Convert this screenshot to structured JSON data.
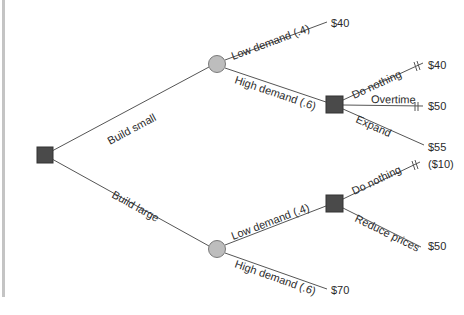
{
  "diagram": {
    "type": "decision-tree",
    "root": {
      "node_type": "decision",
      "branches": [
        {
          "label": "Build small",
          "node_type": "chance",
          "branches": [
            {
              "label": "Low demand (.4)",
              "payoff": "$40"
            },
            {
              "label": "High demand (.6)",
              "node_type": "decision",
              "branches": [
                {
                  "label": "Do nothing",
                  "payoff": "$40",
                  "pruned": true
                },
                {
                  "label": "Overtime",
                  "payoff": "$50",
                  "pruned": true
                },
                {
                  "label": "Expand",
                  "payoff": "$55",
                  "pruned": false
                }
              ]
            }
          ]
        },
        {
          "label": "Build large",
          "node_type": "chance",
          "branches": [
            {
              "label": "Low demand (.4)",
              "node_type": "decision",
              "branches": [
                {
                  "label": "Do nothing",
                  "payoff": "($10)",
                  "pruned": true
                },
                {
                  "label": "Reduce prices",
                  "payoff": "$50",
                  "pruned": false
                }
              ]
            },
            {
              "label": "High demand (.6)",
              "payoff": "$70"
            }
          ]
        }
      ]
    },
    "labels": {
      "build_small": "Build small",
      "build_large": "Build large",
      "bs_low": "Low demand (.4)",
      "bs_high": "High demand (.6)",
      "bs_do_nothing": "Do nothing",
      "bs_overtime": "Overtime",
      "bs_expand": "Expand",
      "bl_low": "Low demand (.4)",
      "bl_high": "High demand (.6)",
      "bl_do_nothing": "Do nothing",
      "bl_reduce_prices": "Reduce prices"
    },
    "payoffs": {
      "bs_low": "$40",
      "bs_do_nothing": "$40",
      "bs_overtime": "$50",
      "bs_expand": "$55",
      "bl_do_nothing": "($10)",
      "bl_reduce_prices": "$50",
      "bl_high": "$70"
    },
    "colors": {
      "decision_node": "#4a4a4a",
      "chance_node": "#bdbdbd",
      "edge": "#555555",
      "left_bar": "#c4c4c4"
    }
  }
}
